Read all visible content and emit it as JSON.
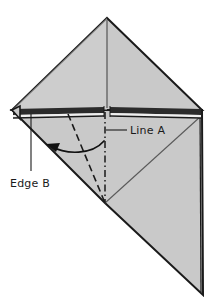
{
  "figure": {
    "kind": "origami-fold-diagram",
    "background_color": "#ffffff",
    "paper_fill": "#c9c9c9",
    "paper_fill_light": "#d4d4d4",
    "outline_color": "#1a1a1a",
    "crease_color": "#1a1a1a",
    "thin_crease_color": "#5a5a5a",
    "labels": [
      {
        "id": "line-a",
        "text": "Line A",
        "x": 130,
        "y": 134,
        "leader_from": [
          106,
          130
        ],
        "leader_to": [
          127,
          130
        ],
        "target": "dash-dot-vertical-crease"
      },
      {
        "id": "edge-b",
        "text": "Edge B",
        "x": 10,
        "y": 187,
        "leader_from": [
          31,
          114
        ],
        "leader_to": [
          31,
          171
        ],
        "target": "folded-layer-edge-left"
      }
    ],
    "geometry": {
      "apex": [
        107,
        18
      ],
      "left_corner": [
        12,
        110
      ],
      "right_corner": [
        202,
        110
      ],
      "bottom_point": [
        203,
        295
      ],
      "fold_vertex": [
        105,
        203
      ],
      "band_top_y": 108,
      "band_bottom_y": 117
    },
    "annotations": {
      "fold_arrow": {
        "type": "curved-arrow",
        "from": [
          104,
          142
        ],
        "to": [
          48,
          146
        ],
        "direction": "right-to-left",
        "meaning": "fold-over"
      },
      "dashed_crease": {
        "type": "valley-fold-dashed",
        "from": [
          68,
          114
        ],
        "to": [
          105,
          203
        ]
      },
      "dash_dot_crease": {
        "type": "fold-reference-dash-dot",
        "from": [
          105,
          112
        ],
        "to": [
          105,
          203
        ]
      }
    }
  }
}
